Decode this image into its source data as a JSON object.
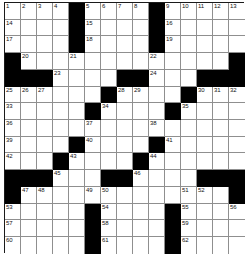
{
  "puzzle": {
    "kind": "crossword-grid",
    "size": {
      "rows": 15,
      "cols": 15
    },
    "colors": {
      "block": "#000000",
      "open": "#ffffff",
      "grid_line": "#8f8f8f",
      "border": "#1a1a1a",
      "number_text": "#111111"
    },
    "blocks": [
      [
        1,
        5
      ],
      [
        1,
        10
      ],
      [
        2,
        5
      ],
      [
        2,
        10
      ],
      [
        3,
        5
      ],
      [
        3,
        10
      ],
      [
        4,
        1
      ],
      [
        4,
        15
      ],
      [
        5,
        1
      ],
      [
        5,
        2
      ],
      [
        5,
        3
      ],
      [
        5,
        8
      ],
      [
        5,
        9
      ],
      [
        5,
        13
      ],
      [
        5,
        14
      ],
      [
        5,
        15
      ],
      [
        6,
        7
      ],
      [
        6,
        12
      ],
      [
        7,
        6
      ],
      [
        7,
        11
      ],
      [
        9,
        5
      ],
      [
        9,
        10
      ],
      [
        10,
        4
      ],
      [
        10,
        9
      ],
      [
        11,
        1
      ],
      [
        11,
        2
      ],
      [
        11,
        3
      ],
      [
        11,
        7
      ],
      [
        11,
        8
      ],
      [
        11,
        13
      ],
      [
        11,
        14
      ],
      [
        11,
        15
      ],
      [
        12,
        1
      ],
      [
        12,
        15
      ],
      [
        13,
        6
      ],
      [
        13,
        11
      ],
      [
        14,
        6
      ],
      [
        14,
        11
      ],
      [
        15,
        6
      ],
      [
        15,
        11
      ]
    ],
    "numbers": [
      {
        "n": 1,
        "row": 1,
        "col": 1
      },
      {
        "n": 2,
        "row": 1,
        "col": 2
      },
      {
        "n": 3,
        "row": 1,
        "col": 3
      },
      {
        "n": 4,
        "row": 1,
        "col": 4
      },
      {
        "n": 5,
        "row": 1,
        "col": 6
      },
      {
        "n": 6,
        "row": 1,
        "col": 7
      },
      {
        "n": 7,
        "row": 1,
        "col": 8
      },
      {
        "n": 8,
        "row": 1,
        "col": 9
      },
      {
        "n": 9,
        "row": 1,
        "col": 11
      },
      {
        "n": 10,
        "row": 1,
        "col": 12
      },
      {
        "n": 11,
        "row": 1,
        "col": 13
      },
      {
        "n": 12,
        "row": 1,
        "col": 14
      },
      {
        "n": 13,
        "row": 1,
        "col": 15
      },
      {
        "n": 14,
        "row": 2,
        "col": 1
      },
      {
        "n": 15,
        "row": 2,
        "col": 6
      },
      {
        "n": 16,
        "row": 2,
        "col": 11
      },
      {
        "n": 17,
        "row": 3,
        "col": 1
      },
      {
        "n": 18,
        "row": 3,
        "col": 6
      },
      {
        "n": 19,
        "row": 3,
        "col": 11
      },
      {
        "n": 20,
        "row": 4,
        "col": 2
      },
      {
        "n": 21,
        "row": 4,
        "col": 5
      },
      {
        "n": 22,
        "row": 4,
        "col": 10
      },
      {
        "n": 23,
        "row": 5,
        "col": 4
      },
      {
        "n": 24,
        "row": 5,
        "col": 10
      },
      {
        "n": 25,
        "row": 6,
        "col": 1
      },
      {
        "n": 26,
        "row": 6,
        "col": 2
      },
      {
        "n": 27,
        "row": 6,
        "col": 3
      },
      {
        "n": 28,
        "row": 6,
        "col": 8
      },
      {
        "n": 29,
        "row": 6,
        "col": 9
      },
      {
        "n": 30,
        "row": 6,
        "col": 13
      },
      {
        "n": 31,
        "row": 6,
        "col": 14
      },
      {
        "n": 32,
        "row": 6,
        "col": 15
      },
      {
        "n": 33,
        "row": 7,
        "col": 1
      },
      {
        "n": 34,
        "row": 7,
        "col": 7
      },
      {
        "n": 35,
        "row": 7,
        "col": 12
      },
      {
        "n": 36,
        "row": 8,
        "col": 1
      },
      {
        "n": 37,
        "row": 8,
        "col": 6
      },
      {
        "n": 38,
        "row": 8,
        "col": 10
      },
      {
        "n": 39,
        "row": 9,
        "col": 1
      },
      {
        "n": 40,
        "row": 9,
        "col": 6
      },
      {
        "n": 41,
        "row": 9,
        "col": 11
      },
      {
        "n": 42,
        "row": 10,
        "col": 1
      },
      {
        "n": 43,
        "row": 10,
        "col": 5
      },
      {
        "n": 44,
        "row": 10,
        "col": 10
      },
      {
        "n": 45,
        "row": 11,
        "col": 4
      },
      {
        "n": 46,
        "row": 11,
        "col": 9
      },
      {
        "n": 47,
        "row": 12,
        "col": 2
      },
      {
        "n": 48,
        "row": 12,
        "col": 3
      },
      {
        "n": 49,
        "row": 12,
        "col": 6
      },
      {
        "n": 50,
        "row": 12,
        "col": 7
      },
      {
        "n": 51,
        "row": 12,
        "col": 12
      },
      {
        "n": 52,
        "row": 12,
        "col": 13
      },
      {
        "n": 53,
        "row": 13,
        "col": 1
      },
      {
        "n": 54,
        "row": 13,
        "col": 7
      },
      {
        "n": 55,
        "row": 13,
        "col": 12
      },
      {
        "n": 56,
        "row": 13,
        "col": 15
      },
      {
        "n": 57,
        "row": 14,
        "col": 1
      },
      {
        "n": 58,
        "row": 14,
        "col": 7
      },
      {
        "n": 59,
        "row": 14,
        "col": 12
      },
      {
        "n": 60,
        "row": 15,
        "col": 1
      },
      {
        "n": 61,
        "row": 15,
        "col": 7
      },
      {
        "n": 62,
        "row": 15,
        "col": 12
      }
    ],
    "entries": []
  }
}
